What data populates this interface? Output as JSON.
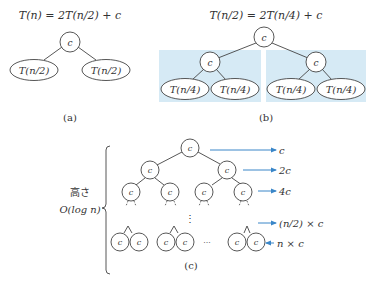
{
  "colors": {
    "highlight": "#d6eaf5",
    "arrow": "#3a86c8",
    "stroke": "#444444"
  },
  "panel_a": {
    "equation": "T(n) = 2T(n/2) + c",
    "root": "c",
    "leaves": [
      "T(n/2)",
      "T(n/2)"
    ],
    "caption": "(a)"
  },
  "panel_b": {
    "equation": "T(n/2) = 2T(n/4) + c",
    "root": "c",
    "children": [
      "c",
      "c"
    ],
    "leaves": [
      "T(n/4)",
      "T(n/4)",
      "T(n/4)",
      "T(n/4)"
    ],
    "caption": "(b)"
  },
  "panel_c": {
    "height_label": "高さ",
    "height_value": "O(log n)",
    "node_label": "c",
    "ellipsis_h": "···",
    "ellipsis_v": "⋮",
    "level_costs": [
      "c",
      "2c",
      "4c",
      "(n/2) × c",
      "n × c"
    ],
    "caption": "(c)"
  }
}
